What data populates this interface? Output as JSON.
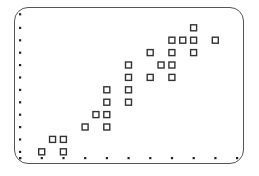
{
  "chart_data": {
    "type": "scatter",
    "title": "",
    "xlabel": "",
    "ylabel": "",
    "xlim": [
      0,
      10
    ],
    "ylim": [
      0,
      11.6
    ],
    "grid": false,
    "legend": null,
    "marker": "open-square",
    "x_ticks": [
      0,
      1,
      2,
      3,
      4,
      5,
      6,
      7,
      8,
      9,
      10
    ],
    "y_ticks": [
      0,
      0.5,
      1.5,
      2.5,
      3.5,
      4.5,
      5.5,
      6.5,
      7.5,
      8.5,
      9.5,
      10.5,
      11.6
    ],
    "tick_labels_visible": false,
    "points": [
      {
        "x": 1,
        "y": 0.5
      },
      {
        "x": 1.5,
        "y": 1.5
      },
      {
        "x": 2,
        "y": 1.5
      },
      {
        "x": 2,
        "y": 0.5
      },
      {
        "x": 3,
        "y": 2.5
      },
      {
        "x": 3.5,
        "y": 3.5
      },
      {
        "x": 4,
        "y": 3.5
      },
      {
        "x": 4,
        "y": 2.5
      },
      {
        "x": 4,
        "y": 4.5
      },
      {
        "x": 4,
        "y": 5.5
      },
      {
        "x": 5,
        "y": 4.5
      },
      {
        "x": 5,
        "y": 5.5
      },
      {
        "x": 5,
        "y": 6.5
      },
      {
        "x": 5,
        "y": 7.5
      },
      {
        "x": 6,
        "y": 6.5
      },
      {
        "x": 6,
        "y": 8.5
      },
      {
        "x": 6.5,
        "y": 7.5
      },
      {
        "x": 7,
        "y": 7.5
      },
      {
        "x": 7,
        "y": 6.5
      },
      {
        "x": 7,
        "y": 8.5
      },
      {
        "x": 7,
        "y": 9.5
      },
      {
        "x": 7.5,
        "y": 9.5
      },
      {
        "x": 8,
        "y": 9.5
      },
      {
        "x": 8,
        "y": 8.5
      },
      {
        "x": 8,
        "y": 10.5
      },
      {
        "x": 9,
        "y": 9.5
      }
    ],
    "colors": {
      "marker": "#333333",
      "ticks": "#222222",
      "frame": "#555555"
    }
  },
  "layout": {
    "origin_px": [
      20,
      158
    ],
    "x_px_per_unit": 21.7,
    "y_px_per_unit": 12.4
  }
}
